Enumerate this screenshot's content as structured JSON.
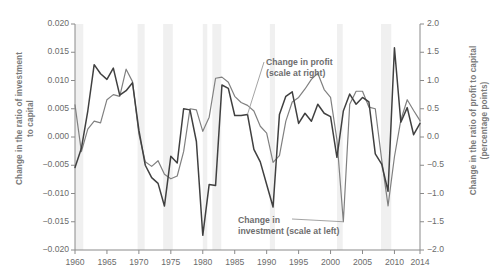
{
  "chart_data": {
    "type": "line",
    "title": "",
    "xlabel": "",
    "ylabel": "Change in the ratio of investment to capital",
    "y2label": "Change in the ratio of profit to capital (percentage points)",
    "grid": false,
    "legend_position": "inline-annotation",
    "xlim": [
      1960,
      2014
    ],
    "ylim": [
      -0.02,
      0.02
    ],
    "y2lim": [
      -2.0,
      2.0
    ],
    "yticks": [
      0.02,
      0.015,
      0.01,
      0.005,
      0.0,
      -0.005,
      -0.01,
      -0.015,
      -0.02
    ],
    "ytick_labels": [
      "0.020",
      "0.015",
      "0.010",
      "0.005",
      "0.000",
      "−0.005",
      "−0.010",
      "−0.015",
      "−0.020"
    ],
    "y2ticks": [
      2.0,
      1.5,
      1.0,
      0.5,
      0.0,
      -0.5,
      -1.0,
      -1.5,
      -2.0
    ],
    "y2tick_labels": [
      "2.0",
      "1.5",
      "1.0",
      "0.5",
      "0.0",
      "−0.5",
      "−1.0",
      "−1.5",
      "−2.0"
    ],
    "xticks": [
      1960,
      1965,
      1970,
      1975,
      1980,
      1985,
      1990,
      1995,
      2000,
      2005,
      2010,
      2014
    ],
    "xtick_labels": [
      "1960",
      "1965",
      "1970",
      "1975",
      "1980",
      "1985",
      "1990",
      "1995",
      "2000",
      "2005",
      "2010",
      "2014"
    ],
    "x": [
      1960,
      1961,
      1962,
      1963,
      1964,
      1965,
      1966,
      1967,
      1968,
      1969,
      1970,
      1971,
      1972,
      1973,
      1974,
      1975,
      1976,
      1977,
      1978,
      1979,
      1980,
      1981,
      1982,
      1983,
      1984,
      1985,
      1986,
      1987,
      1988,
      1989,
      1990,
      1991,
      1992,
      1993,
      1994,
      1995,
      1996,
      1997,
      1998,
      1999,
      2000,
      2001,
      2002,
      2003,
      2004,
      2005,
      2006,
      2007,
      2008,
      2009,
      2010,
      2011,
      2012,
      2013,
      2014
    ],
    "series": [
      {
        "name": "Change in investment (scale at left)",
        "axis": "left",
        "color": "#808080",
        "units": "ratio change",
        "values": [
          0.0057,
          -0.0026,
          0.0014,
          0.0028,
          0.0025,
          0.0066,
          0.0075,
          0.0072,
          0.012,
          0.0098,
          0.0005,
          -0.0044,
          -0.0052,
          -0.0042,
          -0.0066,
          -0.0074,
          -0.0069,
          -0.0026,
          0.005,
          0.0048,
          0.001,
          0.0035,
          0.0104,
          0.0106,
          0.0097,
          0.0072,
          0.0061,
          0.0056,
          0.0046,
          0.0019,
          0.0007,
          -0.0045,
          -0.0033,
          0.0028,
          0.0062,
          0.007,
          0.0085,
          0.0102,
          0.0113,
          0.0084,
          0.007,
          -0.0005,
          -0.015,
          0.0058,
          0.0081,
          0.0081,
          0.0053,
          0.005,
          -0.004,
          -0.0122,
          -0.0035,
          0.003,
          0.0066,
          0.0047,
          0.0029
        ]
      },
      {
        "name": "Change in profit (scale at right)",
        "axis": "right",
        "color": "#404040",
        "units": "percentage points",
        "values": [
          -0.54,
          -0.2,
          0.46,
          1.28,
          1.12,
          1.02,
          1.22,
          0.74,
          0.82,
          0.96,
          0.12,
          -0.5,
          -0.72,
          -0.82,
          -1.22,
          -0.34,
          -0.46,
          0.5,
          0.48,
          -0.08,
          -1.74,
          -0.84,
          -0.86,
          0.92,
          0.86,
          0.38,
          0.38,
          0.4,
          -0.22,
          -0.44,
          -0.84,
          -1.24,
          0.4,
          0.72,
          0.8,
          0.24,
          0.42,
          0.28,
          0.58,
          0.42,
          0.36,
          -0.36,
          0.46,
          0.76,
          0.58,
          0.7,
          0.62,
          -0.3,
          -0.48,
          -0.96,
          1.58,
          0.26,
          0.52,
          0.04,
          0.24
        ]
      }
    ],
    "recession_bands": [
      {
        "start": 1960.0,
        "end": 1961.3
      },
      {
        "start": 1969.8,
        "end": 1970.9
      },
      {
        "start": 1973.8,
        "end": 1975.3
      },
      {
        "start": 1980.0,
        "end": 1980.7
      },
      {
        "start": 1981.5,
        "end": 1982.9
      },
      {
        "start": 1990.5,
        "end": 1991.3
      },
      {
        "start": 2001.0,
        "end": 2001.9
      },
      {
        "start": 2007.9,
        "end": 2009.5
      }
    ],
    "annotations": [
      {
        "id": "profit",
        "text": "Change in profit\n(scale at right)",
        "target_year": 1987,
        "leader": true
      },
      {
        "id": "investment",
        "text": "Change in\ninvestment (scale at left)",
        "target_year": 2002,
        "leader": true
      }
    ]
  },
  "colors": {
    "investment_line": "#808080",
    "profit_line": "#404040",
    "axis": "#8a8a8a",
    "tick_text": "#6b6b6b",
    "axis_title": "#7a7a7a",
    "recession_band": "#f0f0f0",
    "background": "#ffffff"
  },
  "labels": {
    "y_left_title": "Change in the ratio of investment\nto capital",
    "y_right_title": "Change in the ratio of profit to capital\n(percentage points)",
    "profit_annotation": "Change in profit\n(scale at right)",
    "investment_annotation": "Change in\ninvestment (scale at left)"
  }
}
